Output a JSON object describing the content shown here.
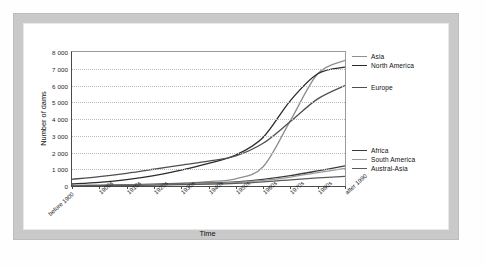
{
  "chart_data": {
    "type": "line",
    "title": "",
    "xlabel": "Time",
    "ylabel": "Number of dams",
    "ylim": [
      0,
      8000
    ],
    "yticks": [
      "0",
      "1 000",
      "2 000",
      "3 000",
      "4 000",
      "5 000",
      "6 000",
      "7 000",
      "8 000"
    ],
    "grid": true,
    "legend_position": "right",
    "categories": [
      "before 1900",
      "1900s",
      "1910s",
      "1920s",
      "1930s",
      "1940s",
      "1950s",
      "1960s",
      "1970s",
      "1980s",
      "after 1990"
    ],
    "series": [
      {
        "name": "Asia",
        "color": "#8e8e8e",
        "values": [
          20,
          40,
          70,
          110,
          170,
          260,
          430,
          1150,
          3900,
          6700,
          7500
        ]
      },
      {
        "name": "North America",
        "color": "#2b2b2b",
        "values": [
          120,
          220,
          380,
          620,
          950,
          1350,
          1850,
          2900,
          5100,
          6700,
          7100
        ]
      },
      {
        "name": "Europe",
        "color": "#4f4f4f",
        "values": [
          400,
          560,
          760,
          1000,
          1250,
          1480,
          1800,
          2550,
          3850,
          5200,
          6000
        ]
      },
      {
        "name": "Africa",
        "color": "#3a3a3a",
        "values": [
          20,
          35,
          60,
          95,
          135,
          180,
          250,
          400,
          620,
          900,
          1200
        ]
      },
      {
        "name": "South America",
        "color": "#9a9a9a",
        "values": [
          15,
          28,
          48,
          75,
          110,
          150,
          210,
          330,
          530,
          800,
          1050
        ]
      },
      {
        "name": "Austral-Asia",
        "color": "#5a5a5a",
        "values": [
          10,
          20,
          35,
          55,
          80,
          110,
          160,
          250,
          370,
          480,
          580
        ]
      }
    ]
  }
}
